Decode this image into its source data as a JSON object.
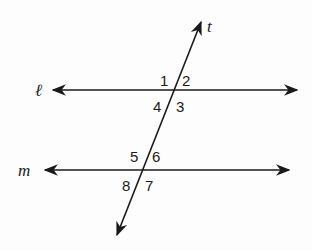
{
  "diagram": {
    "type": "parallel lines cut by a transversal",
    "lines": {
      "l": {
        "label": "ℓ"
      },
      "m": {
        "label": "m"
      },
      "t": {
        "label": "t"
      }
    },
    "angles": {
      "a1": "1",
      "a2": "2",
      "a3": "3",
      "a4": "4",
      "a5": "5",
      "a6": "6",
      "a7": "7",
      "a8": "8"
    },
    "colors": {
      "stroke": "#1a1a1a",
      "background": "#fdfdfd"
    }
  }
}
